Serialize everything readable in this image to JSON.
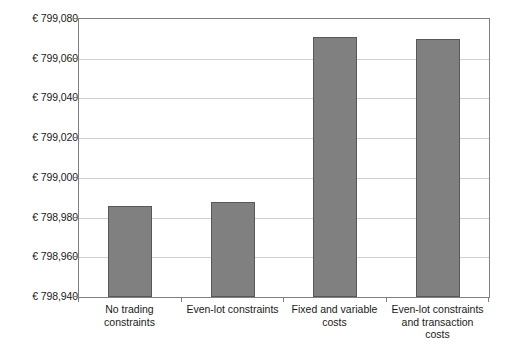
{
  "chart_data": {
    "type": "bar",
    "title": "",
    "subtitle": "",
    "xlabel": "",
    "ylabel": "",
    "categories": [
      "No trading constraints",
      "Even-lot constraints",
      "Fixed and variable costs",
      "Even-lot constraints and transaction costs"
    ],
    "category_lines": [
      [
        "No trading",
        "constraints"
      ],
      [
        "Even-lot constraints"
      ],
      [
        "Fixed and variable",
        "costs"
      ],
      [
        "Even-lot constraints",
        "and transaction",
        "costs"
      ]
    ],
    "values": [
      798986,
      798988,
      799071,
      799070
    ],
    "ylim": [
      798940,
      799080
    ],
    "ytick_values": [
      799080,
      799060,
      799040,
      799020,
      799000,
      798980,
      798960,
      798940
    ],
    "ytick_labels": [
      "€ 799,080",
      "€ 799,060",
      "€ 799,040",
      "€ 799,020",
      "€ 799,000",
      "€ 798,980",
      "€ 798,960",
      "€ 798,940"
    ],
    "currency_symbol": "€",
    "grid": true,
    "legend": false,
    "legend_position": "none",
    "bar_color": "#808080",
    "bar_border_color": "#585858",
    "gridline_color": "#cfcfcf",
    "axis_color": "#808080",
    "background_color": "#ffffff"
  }
}
